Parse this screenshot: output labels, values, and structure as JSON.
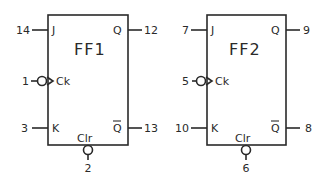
{
  "diagram": {
    "type": "dual JK flip-flop pinout",
    "flip_flops": [
      {
        "name": "FF1",
        "pins": {
          "J": "14",
          "Ck": "1",
          "K": "3",
          "Q": "12",
          "Q_bar": "13",
          "Clr": "2"
        }
      },
      {
        "name": "FF2",
        "pins": {
          "J": "7",
          "Ck": "5",
          "K": "10",
          "Q": "9",
          "Q_bar": "8",
          "Clr": "6"
        }
      }
    ],
    "labels": {
      "J": "J",
      "K": "K",
      "Ck": "Ck",
      "Q": "Q",
      "Q_bar": "Q",
      "Clr": "Clr"
    }
  }
}
